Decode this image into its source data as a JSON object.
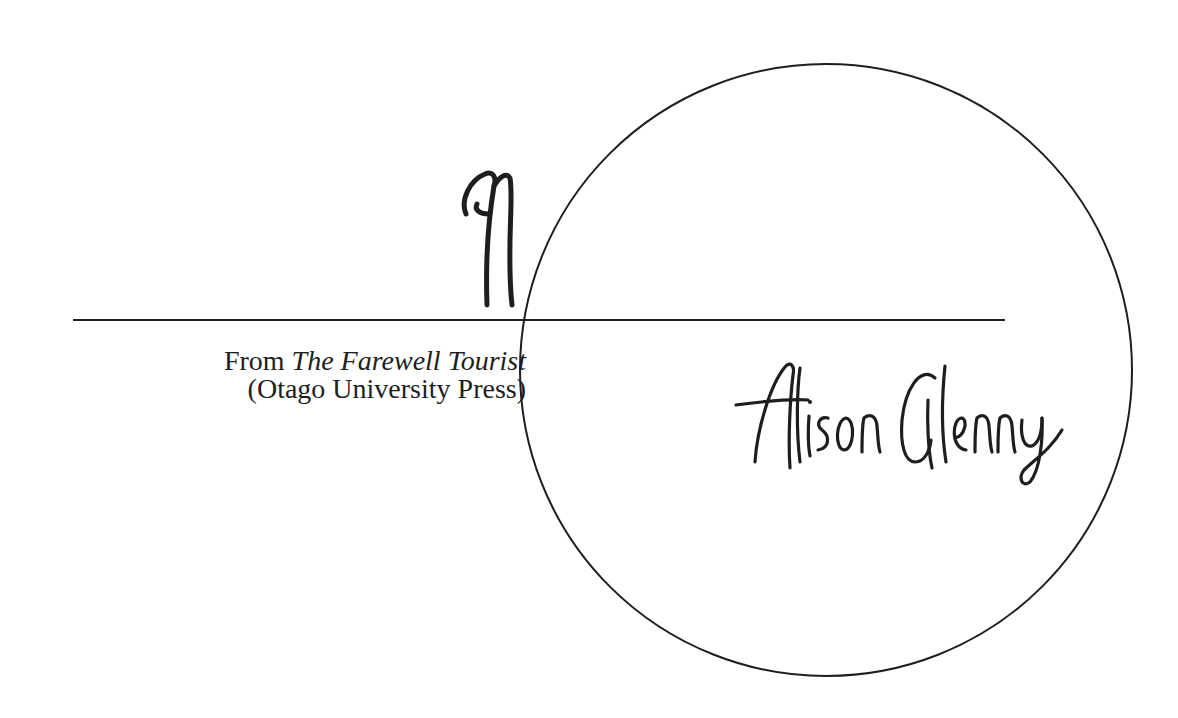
{
  "logo": {
    "monogram": "AG",
    "signature": "Alison Glenny"
  },
  "credit": {
    "prefix": "From ",
    "book_title": "The Farewell Tourist",
    "publisher": "(Otago University Press)"
  },
  "colors": {
    "ink": "#1e1e1e",
    "background": "#ffffff"
  }
}
